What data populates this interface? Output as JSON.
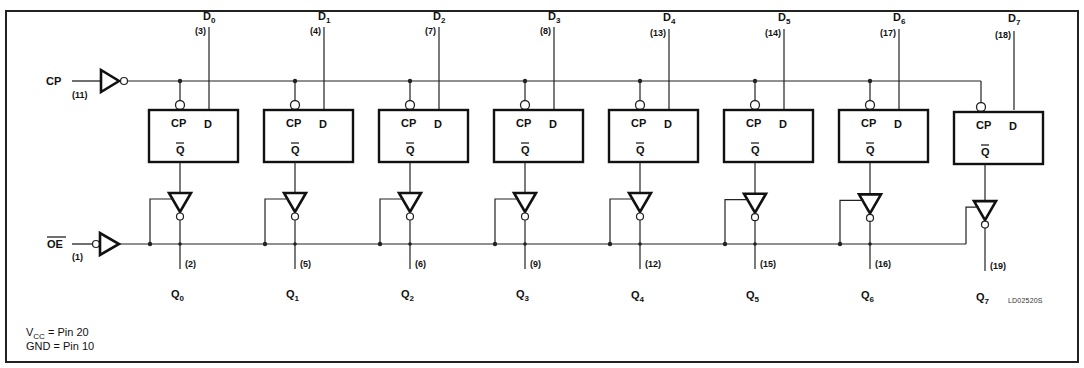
{
  "diagram": {
    "inputs": {
      "clock": {
        "label": "CP",
        "pin": "(11)"
      },
      "output_enable": {
        "label": "OE",
        "overbar": true,
        "pin": "(1)"
      }
    },
    "flip_flop_pin_labels": {
      "clock": "CP",
      "data": "D",
      "output": "Q",
      "output_overbar": true
    },
    "bits": [
      {
        "d_label": "D",
        "d_sub": "0",
        "d_pin": "(3)",
        "q_label": "Q",
        "q_sub": "0",
        "q_pin": "(2)"
      },
      {
        "d_label": "D",
        "d_sub": "1",
        "d_pin": "(4)",
        "q_label": "Q",
        "q_sub": "1",
        "q_pin": "(5)"
      },
      {
        "d_label": "D",
        "d_sub": "2",
        "d_pin": "(7)",
        "q_label": "Q",
        "q_sub": "2",
        "q_pin": "(6)"
      },
      {
        "d_label": "D",
        "d_sub": "3",
        "d_pin": "(8)",
        "q_label": "Q",
        "q_sub": "3",
        "q_pin": "(9)"
      },
      {
        "d_label": "D",
        "d_sub": "4",
        "d_pin": "(13)",
        "q_label": "Q",
        "q_sub": "4",
        "q_pin": "(12)"
      },
      {
        "d_label": "D",
        "d_sub": "5",
        "d_pin": "(14)",
        "q_label": "Q",
        "q_sub": "5",
        "q_pin": "(15)"
      },
      {
        "d_label": "D",
        "d_sub": "6",
        "d_pin": "(17)",
        "q_label": "Q",
        "q_sub": "6",
        "q_pin": "(16)"
      },
      {
        "d_label": "D",
        "d_sub": "7",
        "d_pin": "(18)",
        "q_label": "Q",
        "q_sub": "7",
        "q_pin": "(19)"
      }
    ],
    "notes": {
      "vcc": {
        "name": "V",
        "sub": "CC",
        "text": " = Pin  20"
      },
      "gnd": {
        "text": "GND = Pin  10"
      }
    },
    "drawing_code": "LD02520S"
  }
}
